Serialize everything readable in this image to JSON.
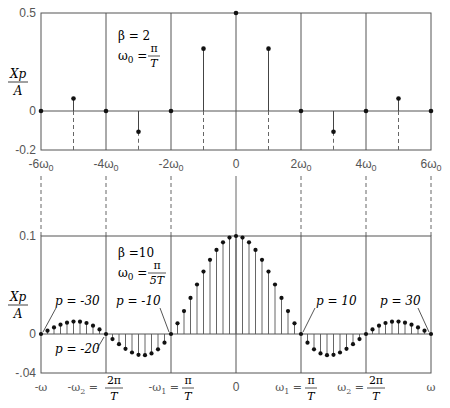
{
  "chart_data": [
    {
      "type": "stem",
      "title": "",
      "ylabel": "Xp/A",
      "xlabel": "",
      "annotation": {
        "beta": "β = 2",
        "omega0": "ω0 = π/T"
      },
      "ylim": [
        -0.2,
        0.5
      ],
      "y_ticks": [
        "0.5",
        "0",
        "-0.2"
      ],
      "x_ticks": [
        "-6ω0",
        "-4ω0",
        "-2ω0",
        "0",
        "2ω0",
        "4ω0",
        "6ω0"
      ],
      "grid_x": [
        -6,
        -4,
        -2,
        0,
        2,
        4,
        6
      ],
      "x": [
        -6,
        -5,
        -4,
        -3,
        -2,
        -1,
        0,
        1,
        2,
        3,
        4,
        5,
        6
      ],
      "values": [
        0,
        0.064,
        0,
        -0.106,
        0,
        0.318,
        0.5,
        0.318,
        0,
        -0.106,
        0,
        0.064,
        0
      ]
    },
    {
      "type": "stem",
      "title": "",
      "ylabel": "Xp/A",
      "xlabel": "ω",
      "annotation": {
        "beta": "β =10",
        "omega0": "ω0 = π/5T"
      },
      "ylim": [
        -0.04,
        0.1
      ],
      "y_ticks": [
        "0.1",
        "0",
        "-.04"
      ],
      "x_ticks": [
        "-ω",
        "-ω2 = 2π/T",
        "-ω1 = π/T",
        "0",
        "ω1 = π/T",
        "ω2 = 2π/T",
        "ω"
      ],
      "grid_p": [
        -30,
        -20,
        -10,
        0,
        10,
        20,
        30
      ],
      "point_labels": [
        {
          "p": -30,
          "text": "p = -30"
        },
        {
          "p": -20,
          "text": "p = -20"
        },
        {
          "p": -10,
          "text": "p = -10"
        },
        {
          "p": 10,
          "text": "p = 10"
        },
        {
          "p": 30,
          "text": "p = 30"
        }
      ],
      "x": [
        -30,
        -29,
        -28,
        -27,
        -26,
        -25,
        -24,
        -23,
        -22,
        -21,
        -20,
        -19,
        -18,
        -17,
        -16,
        -15,
        -14,
        -13,
        -12,
        -11,
        -10,
        -9,
        -8,
        -7,
        -6,
        -5,
        -4,
        -3,
        -2,
        -1,
        0,
        1,
        2,
        3,
        4,
        5,
        6,
        7,
        8,
        9,
        10,
        11,
        12,
        13,
        14,
        15,
        16,
        17,
        18,
        19,
        20,
        21,
        22,
        23,
        24,
        25,
        26,
        27,
        28,
        29,
        30
      ],
      "values": [
        0,
        0.0034,
        0.0067,
        0.0095,
        0.0116,
        0.0127,
        0.0126,
        0.0112,
        0.0085,
        0.0047,
        0,
        -0.0052,
        -0.0104,
        -0.0151,
        -0.0189,
        -0.0212,
        -0.0216,
        -0.0198,
        -0.0156,
        -0.0089,
        0,
        0.0109,
        0.0234,
        0.0368,
        0.0505,
        0.0637,
        0.0757,
        0.0858,
        0.0935,
        0.0984,
        0.1,
        0.0984,
        0.0935,
        0.0858,
        0.0757,
        0.0637,
        0.0505,
        0.0368,
        0.0234,
        0.0109,
        0,
        -0.0089,
        -0.0156,
        -0.0198,
        -0.0216,
        -0.0212,
        -0.0189,
        -0.0151,
        -0.0104,
        -0.0052,
        0,
        0.0047,
        0.0085,
        0.0112,
        0.0126,
        0.0127,
        0.0116,
        0.0095,
        0.0067,
        0.0034,
        0
      ]
    }
  ],
  "labels": {
    "top": {
      "y_top": "0.5",
      "y_zero": "0",
      "y_bottom": "-0.2",
      "ylabel_num": "Xp",
      "ylabel_den": "A",
      "beta": "β = 2",
      "omega0_lhs": "ω",
      "omega0_sub": "0",
      "omega0_eq": " = ",
      "omega0_num": "π",
      "omega0_den": "T",
      "xt": [
        {
          "main": "-6ω",
          "sub": "0"
        },
        {
          "main": "-4ω",
          "sub": "0"
        },
        {
          "main": "-2ω",
          "sub": "0"
        },
        {
          "main": "0",
          "sub": ""
        },
        {
          "main": "2ω",
          "sub": "0"
        },
        {
          "main": "4ω",
          "sub": "0"
        },
        {
          "main": "6ω",
          "sub": "0"
        }
      ]
    },
    "bottom": {
      "y_top": "0.1",
      "y_zero": "0",
      "y_bottom": "-.04",
      "ylabel_num": "Xp",
      "ylabel_den": "A",
      "beta": "β =10",
      "omega0_lhs": "ω",
      "omega0_sub": "0",
      "omega0_eq": " = ",
      "omega0_num": "π",
      "omega0_den": "5T",
      "p_m30": "p = -30",
      "p_m20": "p = -20",
      "p_m10": "p = -10",
      "p_10": "p = 10",
      "p_30": "p = 30",
      "xt_minus_omega": "-ω",
      "xt_minus_w2": "-ω",
      "xt_minus_w2_sub": "2",
      "xt_w2_num": "2π",
      "xt_w2_den": "T",
      "xt_minus_w1": "-ω",
      "xt_minus_w1_sub": "1",
      "xt_w1_num": "π",
      "xt_w1_den": "T",
      "xt_zero": "0",
      "xt_w1": "ω",
      "xt_w1_sub": "1",
      "xt_w2": "ω",
      "xt_w2_sub": "2",
      "xt_omega": "ω",
      "eq": " = "
    }
  },
  "colors": {
    "ink": "#2a2a2a",
    "frame": "#555555",
    "background": "#ffffff"
  }
}
